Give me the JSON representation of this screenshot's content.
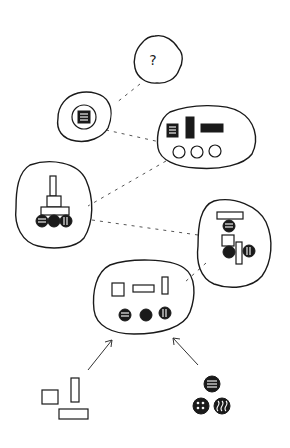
{
  "diagram": {
    "title": "",
    "top_node": {
      "label": "?"
    },
    "nodes": [
      {
        "id": "unknown",
        "content": "question mark"
      },
      {
        "id": "single-module",
        "content": "one striped square inside circle"
      },
      {
        "id": "component-set",
        "content": "three textured blocks and three empty circles"
      },
      {
        "id": "stacked-tower",
        "content": "stacked rectangles on three textured balls"
      },
      {
        "id": "assembled-mix",
        "content": "rectangles interleaved with textured balls"
      },
      {
        "id": "combined-pool",
        "content": "three rectangles and three textured balls"
      }
    ],
    "inputs": [
      {
        "id": "rectangles",
        "content": "three outlined rectangles"
      },
      {
        "id": "balls",
        "content": "three textured black balls"
      }
    ],
    "colors": {
      "ink": "#1a1a1a",
      "paper": "#ffffff"
    }
  }
}
